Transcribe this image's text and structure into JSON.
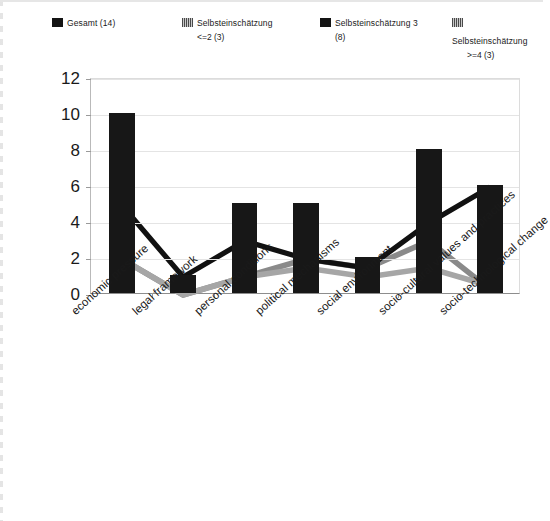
{
  "legend": {
    "items": [
      {
        "label_line1": "Gesamt (14)",
        "label_line2": "",
        "swatch": "black-square-icon",
        "color": "#141414"
      },
      {
        "label_line1": "Selbsteinschätzung",
        "label_line2": "<=2 (3)",
        "swatch": "gray-hatch-square-icon",
        "color": "#7d7d7d"
      },
      {
        "label_line1": "Selbsteinschätzung 3",
        "label_line2": "(8)",
        "swatch": "black-square-icon",
        "color": "#141414"
      },
      {
        "label_line1": "Selbsteinschätzung",
        "label_line2": ">=4 (3)",
        "swatch": "gray-hatch-square-icon",
        "color": "#9a9a9a"
      }
    ]
  },
  "chart_data": {
    "type": "bar",
    "title": "",
    "xlabel": "",
    "ylabel": "",
    "ylim": [
      0,
      12
    ],
    "yticks": [
      0,
      2,
      4,
      6,
      8,
      10,
      12
    ],
    "grid": true,
    "legend_position": "top",
    "categories": [
      "economic pressure",
      "legal framework",
      "personal conditions",
      "political mechanisms",
      "social environment",
      "socio-cultural values and practices",
      "socio-technological change"
    ],
    "series": [
      {
        "name": "Gesamt (14)",
        "render": "bar",
        "color": "#171717",
        "values": [
          10,
          1,
          5,
          5,
          2,
          8,
          6
        ]
      },
      {
        "name": "Selbsteinschätzung <=2 (3)",
        "render": "line",
        "color": "#8a8a8a",
        "values": [
          2,
          0,
          1,
          2,
          1.5,
          3,
          0.3
        ]
      },
      {
        "name": "Selbsteinschätzung 3 (8)",
        "render": "line",
        "color": "#111111",
        "values": [
          5,
          1,
          3,
          2,
          1.5,
          4,
          6
        ]
      },
      {
        "name": "Selbsteinschätzung >=4 (3)",
        "render": "line",
        "color": "#a6a6a6",
        "values": [
          2,
          0,
          1,
          1.5,
          1,
          1.5,
          0.5
        ]
      }
    ]
  }
}
